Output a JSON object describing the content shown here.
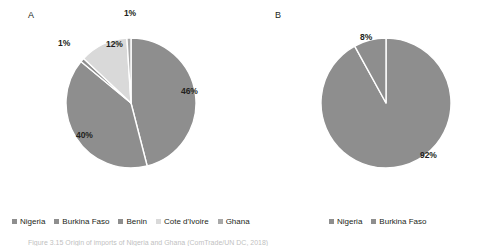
{
  "figure": {
    "background": "#ffffff",
    "caption": "Figure 3.15  Origin of imports of Nigeria and Ghana (ComTrade/UN DC, 2018)"
  },
  "colors": {
    "slice_primary": "#8e8e8e",
    "slice_light": "#d9d9d9",
    "slice_divider": "#ffffff",
    "text": "#231f20"
  },
  "panels": [
    {
      "letter": "A",
      "letter_x": 28,
      "letter_y": 10,
      "center_x": 131,
      "center_y": 103,
      "radius": 65,
      "labels": [
        {
          "text": "1%",
          "x": 130,
          "y": 8,
          "align": "center"
        },
        {
          "text": "1%",
          "x": 58,
          "y": 38,
          "align": "left"
        },
        {
          "text": "12%",
          "x": 106,
          "y": 39,
          "align": "left"
        },
        {
          "text": "46%",
          "x": 181,
          "y": 86,
          "align": "left"
        },
        {
          "text": "40%",
          "x": 76,
          "y": 130,
          "align": "left"
        }
      ],
      "legend": {
        "x": 12,
        "y": 217,
        "items": [
          {
            "label": "Nigeria",
            "color": "#8e8e8e"
          },
          {
            "label": "Burkina Faso",
            "color": "#8e8e8e"
          },
          {
            "label": "Benin",
            "color": "#8e8e8e"
          },
          {
            "label": "Cote d'Ivoire",
            "color": "#d9d9d9"
          },
          {
            "label": "Ghana",
            "color": "#a8a8a8"
          }
        ]
      }
    },
    {
      "letter": "B",
      "letter_x": 275,
      "letter_y": 10,
      "center_x": 386,
      "center_y": 103,
      "radius": 65,
      "labels": [
        {
          "text": "8%",
          "x": 360,
          "y": 32,
          "align": "left"
        },
        {
          "text": "92%",
          "x": 420,
          "y": 150,
          "align": "left"
        }
      ],
      "legend": {
        "x": 329,
        "y": 217,
        "items": [
          {
            "label": "Nigeria",
            "color": "#8e8e8e"
          },
          {
            "label": "Burkina Faso",
            "color": "#8e8e8e"
          }
        ]
      }
    }
  ],
  "chart_data": [
    {
      "type": "pie",
      "title": "A",
      "categories": [
        "Nigeria",
        "Burkina Faso",
        "Benin",
        "Cote d'Ivoire",
        "Ghana"
      ],
      "values": [
        46,
        40,
        1,
        12,
        1
      ],
      "value_labels": [
        "46%",
        "40%",
        "1%",
        "12%",
        "1%"
      ],
      "slice_colors": [
        "#8e8e8e",
        "#8e8e8e",
        "#8e8e8e",
        "#d9d9d9",
        "#a8a8a8"
      ],
      "units": "percent",
      "start_angle_deg": 0,
      "direction": "clockwise",
      "legend_position": "bottom",
      "grid": false
    },
    {
      "type": "pie",
      "title": "B",
      "categories": [
        "Nigeria",
        "Burkina Faso"
      ],
      "values": [
        92,
        8
      ],
      "value_labels": [
        "92%",
        "8%"
      ],
      "slice_colors": [
        "#8e8e8e",
        "#8e8e8e"
      ],
      "units": "percent",
      "start_angle_deg": 0,
      "direction": "clockwise",
      "legend_position": "bottom",
      "grid": false
    }
  ]
}
